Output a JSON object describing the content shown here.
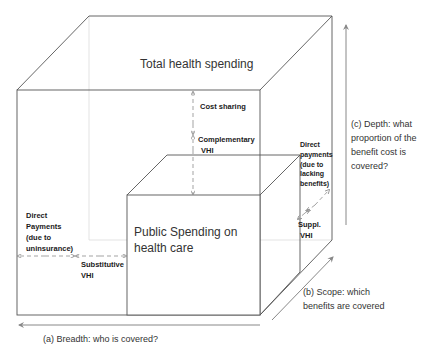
{
  "diagram": {
    "title": "Total health spending",
    "inner_box": "Public Spending on health care",
    "inner_box_lines": [
      "Public Spending on",
      "health care"
    ],
    "labels": {
      "cost_sharing": "Cost sharing",
      "complementary_vhi": [
        "Complementary",
        "VHI"
      ],
      "direct_payments_uninsurance": [
        "Direct",
        "Payments",
        "(due to",
        "uninsurance)"
      ],
      "substitutive_vhi": [
        "Substitutive",
        "VHI"
      ],
      "direct_payments_lacking": [
        "Direct",
        "payments",
        "(due to",
        "lacking",
        "benefits)"
      ],
      "suppl_vhi": [
        "Suppl.",
        "VHI"
      ]
    },
    "axes": {
      "breadth": "(a) Breadth: who is covered?",
      "scope": [
        "(b) Scope: which",
        "benefits are covered"
      ],
      "depth": [
        "(c) Depth: what",
        "proportion of the",
        "benefit cost is",
        "covered?"
      ]
    },
    "colors": {
      "line": "#555555",
      "arrow": "#888888",
      "dashed": "#999999"
    }
  }
}
